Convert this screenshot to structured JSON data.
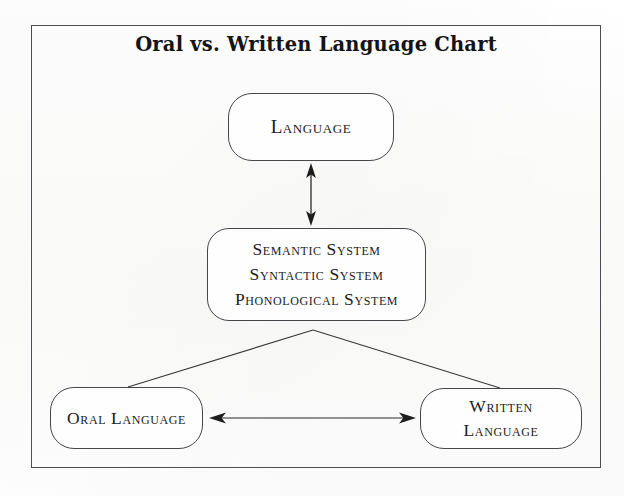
{
  "document": {
    "title": "Oral vs. Written Language Chart",
    "background_color": "#fdfdfd",
    "frame_color": "#4e4e52",
    "text_color": "#1b1b1b"
  },
  "diagram": {
    "type": "flow-chart",
    "nodes": [
      {
        "id": "language",
        "name": "language-node",
        "lines": [
          "Language"
        ],
        "shape": "rounded-rectangle"
      },
      {
        "id": "systems",
        "name": "systems-node",
        "lines": [
          "Semantic System",
          "Syntactic System",
          "Phonological System"
        ],
        "shape": "rounded-rectangle"
      },
      {
        "id": "oral",
        "name": "oral-language-node",
        "lines": [
          "Oral Language"
        ],
        "shape": "rounded-rectangle"
      },
      {
        "id": "written",
        "name": "written-language-node",
        "lines": [
          "Written",
          "Language"
        ],
        "shape": "rounded-rectangle"
      }
    ],
    "connectors": [
      {
        "id": "language-systems",
        "from": "language",
        "to": "systems",
        "style": "double-arrow",
        "orientation": "vertical"
      },
      {
        "id": "systems-oral",
        "from": "systems",
        "to": "oral",
        "style": "plain-line",
        "orientation": "diagonal"
      },
      {
        "id": "systems-written",
        "from": "systems",
        "to": "written",
        "style": "plain-line",
        "orientation": "diagonal"
      },
      {
        "id": "oral-written",
        "from": "oral",
        "to": "written",
        "style": "double-arrow",
        "orientation": "horizontal"
      }
    ]
  }
}
